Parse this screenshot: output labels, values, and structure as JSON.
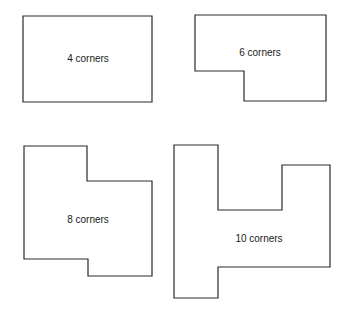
{
  "diagram": {
    "shapes": [
      {
        "id": "rect-4",
        "label": "4 corners",
        "corners": 4
      },
      {
        "id": "poly-6",
        "label": "6 corners",
        "corners": 6
      },
      {
        "id": "poly-8",
        "label": "8 corners",
        "corners": 8
      },
      {
        "id": "poly-10",
        "label": "10 corners",
        "corners": 10
      }
    ],
    "stroke_color": "#2a2a2a",
    "fill_color": "#ffffff"
  }
}
